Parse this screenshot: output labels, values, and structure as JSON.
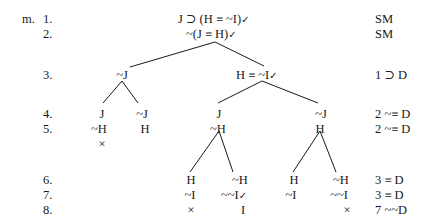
{
  "problem_label": "m.",
  "line_numbers": [
    "1.",
    "2.",
    "3.",
    "4.",
    "5.",
    "6.",
    "7.",
    "8."
  ],
  "nodes": {
    "l1": "J ⊃ (H ≡ ~I)",
    "l2": "~(J ≡ H)",
    "l3_left": "~J",
    "l3_right": "H ≡ ~I",
    "l4_a": "J",
    "l4_b": "~J",
    "l4_c": "J",
    "l4_d": "~J",
    "l5_a": "~H",
    "l5_b": "H",
    "l5_c": "~H",
    "l5_d": "H",
    "l5_close": "×",
    "l6_a": "H",
    "l6_b": "~H",
    "l6_c": "H",
    "l6_d": "~H",
    "l7_a": "~I",
    "l7_b": "~~I",
    "l7_c": "~I",
    "l7_d": "~~I",
    "l8_a": "×",
    "l8_b": "I",
    "l8_d": "×"
  },
  "check_mark": "✓",
  "justifications": [
    "SM",
    "SM",
    "1 ⊃ D",
    "2 ~≡ D",
    "2 ~≡ D",
    "3 ≡ D",
    "3 ≡ D",
    "7 ~~D"
  ]
}
